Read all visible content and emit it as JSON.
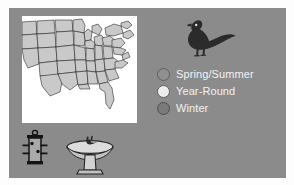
{
  "figure": {
    "panel_color": "#8b8b8b",
    "background_color": "#ffffff"
  },
  "map": {
    "name": "united-states-range-map",
    "land_fill": "#c9c9c9",
    "ocean_fill": "#ffffff",
    "border_color": "#1a1a1a",
    "region": "Eastern and Central United States"
  },
  "bird": {
    "name": "pigeon-silhouette",
    "species": "Rock Pigeon",
    "fill": "#2b2b2b",
    "facing": "left"
  },
  "legend": {
    "items": [
      {
        "label": "Spring/Summer",
        "color": "#8f8f8f",
        "stroke": "#5e5e5e"
      },
      {
        "label": "Year-Round",
        "color": "#ededed",
        "stroke": "#5e5e5e"
      },
      {
        "label": "Winter",
        "color": "#7a7a7a",
        "stroke": "#4f4f4f"
      }
    ],
    "text_color": "#f2f2f2"
  },
  "feeder": {
    "name": "tube-bird-feeder",
    "fill": "#1c1c1c"
  },
  "birdbath": {
    "name": "pedestal-birdbath",
    "fill": "#d8d8d8",
    "outline": "#2a2a2a"
  }
}
